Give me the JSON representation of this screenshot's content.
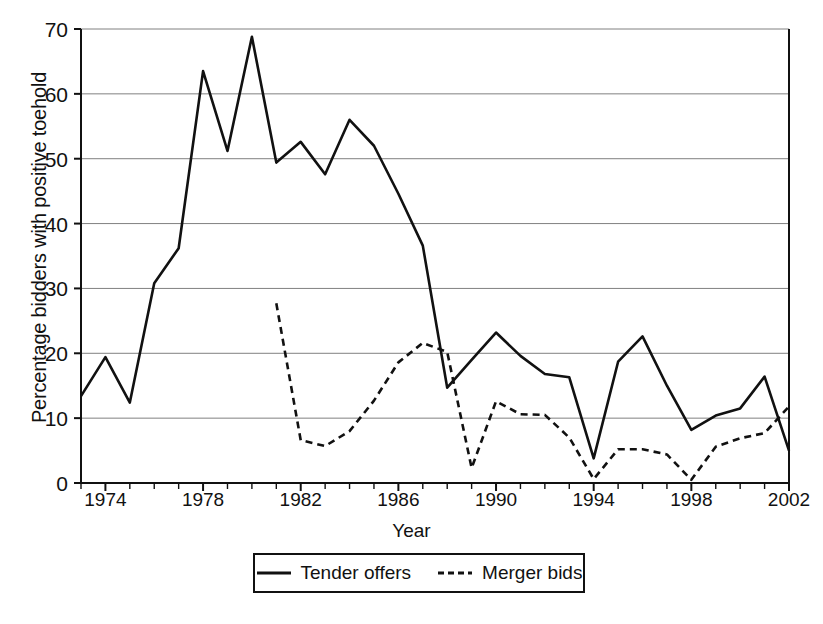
{
  "chart_data": {
    "type": "line",
    "title": "",
    "xlabel": "Year",
    "ylabel": "Percentage bidders with positive toehold",
    "xlim": [
      1973,
      2002
    ],
    "ylim": [
      0,
      70
    ],
    "ytick_labels": [
      "0",
      "10",
      "20",
      "30",
      "40",
      "50",
      "60",
      "70"
    ],
    "ytick_values": [
      0,
      10,
      20,
      30,
      40,
      50,
      60,
      70
    ],
    "xtick_labels": [
      "1974",
      "1978",
      "1982",
      "1986",
      "1990",
      "1994",
      "1998",
      "2002"
    ],
    "xtick_values": [
      1974,
      1978,
      1982,
      1986,
      1990,
      1994,
      1998,
      2002
    ],
    "minor_xticks_every": 1,
    "grid": "horizontal",
    "legend_position": "below-plot",
    "x": [
      1973,
      1974,
      1975,
      1976,
      1977,
      1978,
      1979,
      1980,
      1981,
      1982,
      1983,
      1984,
      1985,
      1986,
      1987,
      1988,
      1989,
      1990,
      1991,
      1992,
      1993,
      1994,
      1995,
      1996,
      1997,
      1998,
      1999,
      2000,
      2001,
      2002
    ],
    "series": [
      {
        "name": "Tender offers",
        "style": "solid",
        "color": "#111111",
        "x": [
          1973,
          1974,
          1975,
          1976,
          1977,
          1978,
          1979,
          1980,
          1981,
          1982,
          1983,
          1984,
          1985,
          1986,
          1987,
          1988,
          1989,
          1990,
          1991,
          1992,
          1993,
          1994,
          1995,
          1996,
          1997,
          1998,
          1999,
          2000,
          2001,
          2002
        ],
        "values": [
          13.4,
          19.4,
          12.4,
          30.8,
          36.2,
          63.5,
          51.2,
          68.8,
          49.4,
          52.6,
          47.6,
          56.0,
          52.0,
          44.6,
          36.6,
          14.7,
          19.0,
          23.2,
          19.6,
          16.8,
          16.3,
          3.8,
          18.7,
          22.6,
          15.0,
          8.2,
          10.4,
          11.5,
          16.4,
          5.0
        ]
      },
      {
        "name": "Merger bids",
        "style": "dashed",
        "color": "#111111",
        "x": [
          1981,
          1982,
          1983,
          1984,
          1985,
          1986,
          1987,
          1988,
          1989,
          1990,
          1991,
          1992,
          1993,
          1994,
          1995,
          1996,
          1997,
          1998,
          1999,
          2000,
          2001,
          2002
        ],
        "values": [
          27.7,
          6.6,
          5.7,
          8.0,
          12.7,
          18.6,
          21.6,
          20.2,
          2.3,
          12.6,
          10.6,
          10.5,
          7.0,
          0.6,
          5.2,
          5.2,
          4.4,
          0.5,
          5.6,
          6.9,
          7.7,
          11.8
        ]
      }
    ]
  },
  "legend": {
    "items": [
      {
        "label": "Tender offers",
        "style": "solid"
      },
      {
        "label": "Merger bids",
        "style": "dashed"
      }
    ]
  }
}
